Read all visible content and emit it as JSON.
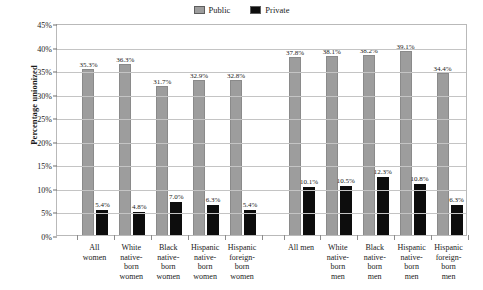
{
  "chart_data": {
    "type": "bar",
    "title": "",
    "subtitle": "",
    "xlabel": "",
    "ylabel": "Percentage unionized",
    "ylim": [
      0,
      45
    ],
    "ytick_values": [
      0,
      5,
      10,
      15,
      20,
      25,
      30,
      35,
      40,
      45
    ],
    "ytick_labels": [
      "0%",
      "5%",
      "10%",
      "15%",
      "20%",
      "25%",
      "30%",
      "35%",
      "40%",
      "45%"
    ],
    "grid": true,
    "legend_position": "top-center",
    "legend": [
      {
        "name": "Public",
        "color": "#9d9d9d"
      },
      {
        "name": "Private",
        "color": "#0d0d0d"
      }
    ],
    "categories": [
      "All\nwomen",
      "White\nnative-\nborn\nwomen",
      "Black\nnative-\nborn\nwomen",
      "Hispanic\nnative-\nborn\nwomen",
      "Hispanic\nforeign-\nborn\nwomen",
      "All men",
      "White\nnative-\nborn\nmen",
      "Black\nnative-\nborn\nmen",
      "Hispanic\nnative-\nborn\nmen",
      "Hispanic\nforeign-\nborn\nmen"
    ],
    "series": [
      {
        "name": "Public",
        "color": "#9d9d9d",
        "values": [
          35.3,
          36.3,
          31.7,
          32.9,
          32.8,
          37.8,
          38.1,
          38.2,
          39.1,
          34.4
        ],
        "labels": [
          "35.3%",
          "36.3%",
          "31.7%",
          "32.9%",
          "32.8%",
          "37.8%",
          "38.1%",
          "38.2%",
          "39.1%",
          "34.4%"
        ]
      },
      {
        "name": "Private",
        "color": "#0d0d0d",
        "values": [
          5.4,
          4.8,
          7.0,
          6.3,
          5.4,
          10.1,
          10.5,
          12.3,
          10.8,
          6.3
        ],
        "labels": [
          "5.4%",
          "4.8%",
          "7.0%",
          "6.3%",
          "5.4%",
          "10.1%",
          "10.5%",
          "12.3%",
          "10.8%",
          "6.3%"
        ]
      }
    ],
    "group_gap_after_index": 4
  }
}
